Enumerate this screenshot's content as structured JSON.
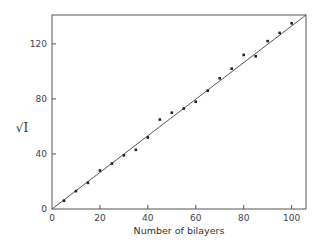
{
  "chart_data": {
    "type": "scatter",
    "title": "",
    "xlabel": "Number of bilayers",
    "ylabel": "√I",
    "xlim": [
      0,
      106
    ],
    "ylim": [
      0,
      141
    ],
    "x_ticks": [
      0,
      20,
      40,
      60,
      80,
      100
    ],
    "y_ticks": [
      0,
      40,
      80,
      120
    ],
    "grid": false,
    "legend": null,
    "series": [
      {
        "name": "measured",
        "marker": "square",
        "x": [
          5,
          10,
          15,
          20,
          25,
          30,
          35,
          40,
          45,
          50,
          55,
          60,
          65,
          70,
          75,
          80,
          85,
          90,
          95,
          100
        ],
        "y": [
          6,
          13,
          19,
          28,
          33,
          39,
          43,
          52,
          65,
          70,
          73,
          78,
          86,
          95,
          102,
          112,
          111,
          122,
          128,
          135
        ]
      },
      {
        "name": "linear fit",
        "style": "line",
        "x": [
          0,
          106
        ],
        "y": [
          0,
          141
        ]
      }
    ]
  },
  "labels": {
    "xlabel": "Number of bilayers",
    "ylabel": "√I",
    "x_ticks": [
      "0",
      "20",
      "40",
      "60",
      "80",
      "100"
    ],
    "y_ticks": [
      "0",
      "40",
      "80",
      "120"
    ]
  }
}
